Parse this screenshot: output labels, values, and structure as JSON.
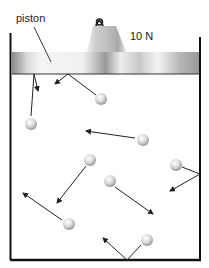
{
  "labels": {
    "piston": "piston",
    "weight": "10 N"
  },
  "diagram": {
    "container": {
      "left": 10,
      "right": 200,
      "top": 33,
      "bottom": 260
    },
    "piston": {
      "x": 12,
      "y": 52,
      "width": 187,
      "height": 22
    },
    "weight": {
      "label": "10 N",
      "x_left_bottom": 87,
      "x_right_bottom": 126,
      "top": 22,
      "bottom": 52
    },
    "molecules": [
      {
        "x": 101,
        "y": 99
      },
      {
        "x": 31,
        "y": 124
      },
      {
        "x": 143,
        "y": 140
      },
      {
        "x": 90,
        "y": 160
      },
      {
        "x": 176,
        "y": 165
      },
      {
        "x": 110,
        "y": 181
      },
      {
        "x": 69,
        "y": 224
      },
      {
        "x": 147,
        "y": 240
      }
    ]
  }
}
